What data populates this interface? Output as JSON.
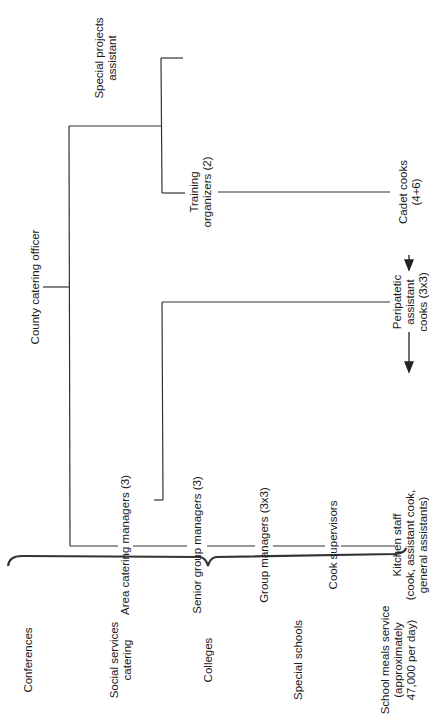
{
  "chart": {
    "title": "",
    "root": {
      "label": "County catering officer"
    },
    "branches": {
      "training": {
        "label_line1": "Training",
        "label_line2": "organizers (2)"
      },
      "special_projects": {
        "label_line1": "Special projects",
        "label_line2": "assistant"
      },
      "cadet_cooks": {
        "label_line1": "Cadet cooks",
        "label_line2": "(4+6)"
      },
      "area_managers": {
        "label": "Area catering managers (3)"
      },
      "senior_group_managers": {
        "label": "Senior group managers (3)"
      },
      "group_managers": {
        "label": "Group managers (3x3)"
      },
      "cook_supervisors": {
        "label": "Cook supervisors"
      },
      "kitchen_staff": {
        "label_line1": "Kitchen staff",
        "label_line2": "(cook, assistant cook,",
        "label_line3": "general assistants)"
      },
      "peripatetic": {
        "label_line1": "Peripatetic",
        "label_line2": "assistant",
        "label_line3": "cooks (3x3)"
      }
    },
    "services": [
      {
        "label_line1": "Conferences"
      },
      {
        "label_line1": "Social services",
        "label_line2": "catering"
      },
      {
        "label_line1": "Colleges"
      },
      {
        "label_line1": "Special schools"
      },
      {
        "label_line1": "School meals service",
        "label_line2": "(approximately",
        "label_line3": "47,000 per day)"
      }
    ],
    "line_color": "#333333"
  }
}
